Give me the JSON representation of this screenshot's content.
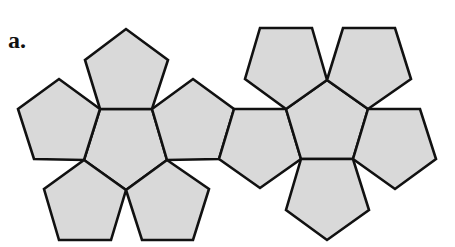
{
  "figure": {
    "label": "a.",
    "fill_color": "#d9d9d9",
    "stroke_color": "#111111"
  },
  "pentagons": [
    {
      "id": "left-center",
      "points": "100,109 152,109 167,160 126,190 84,160"
    },
    {
      "id": "left-top",
      "points": "100,109 85,60 126,29 168,60 152,109"
    },
    {
      "id": "left-upper-left",
      "points": "100,109 59,79 18,109 34,159 84,160"
    },
    {
      "id": "left-lower-left",
      "points": "84,160 44,189 59,240 111,240 126,190"
    },
    {
      "id": "left-lower-right",
      "points": "126,190 142,240 193,240 209,189 167,160"
    },
    {
      "id": "left-upper-right",
      "points": "152,109 193,79 234,109 219,159 167,160"
    },
    {
      "id": "right-left-joiner",
      "points": "234,109 286,109 301,159 260,188 219,159"
    },
    {
      "id": "right-center",
      "points": "327,80 368,109 353,159 301,159 286,109"
    },
    {
      "id": "right-top-left",
      "points": "286,109 245,79 260,28 312,28 327,80"
    },
    {
      "id": "right-top-right",
      "points": "327,80 343,28 395,28 411,79 368,109"
    },
    {
      "id": "right-right",
      "points": "368,109 420,109 436,159 395,189 353,159"
    },
    {
      "id": "right-bottom",
      "points": "301,159 353,159 369,210 327,240 286,210"
    }
  ]
}
